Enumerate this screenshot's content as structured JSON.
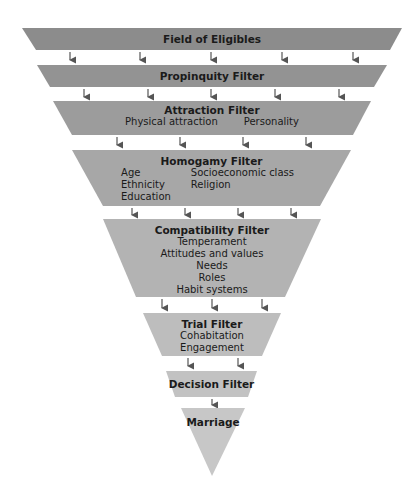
{
  "diagram": {
    "type": "filter-funnel",
    "colors": {
      "layer_fills": [
        "#8c8c8c",
        "#939393",
        "#9c9c9c",
        "#a7a7a7",
        "#b3b3b3",
        "#bdbdbd",
        "#c2c2c2",
        "#c7c7c7"
      ],
      "arrow": "#555555",
      "text": "#1a1a1a"
    },
    "layers": [
      {
        "title": "Field of Eligibles",
        "items": []
      },
      {
        "title": "Propinquity Filter",
        "items": []
      },
      {
        "title": "Attraction Filter",
        "items": [
          "Physical attraction",
          "Personality"
        ]
      },
      {
        "title": "Homogamy Filter",
        "items_col1": [
          "Age",
          "Ethnicity",
          "Education"
        ],
        "items_col2": [
          "Socioeconomic class",
          "Religion"
        ]
      },
      {
        "title": "Compatibility Filter",
        "items": [
          "Temperament",
          "Attitudes and values",
          "Needs",
          "Roles",
          "Habit systems"
        ]
      },
      {
        "title": "Trial Filter",
        "items": [
          "Cohabitation",
          "Engagement"
        ]
      },
      {
        "title": "Decision Filter",
        "items": []
      },
      {
        "title": "Marriage",
        "items": []
      }
    ]
  }
}
